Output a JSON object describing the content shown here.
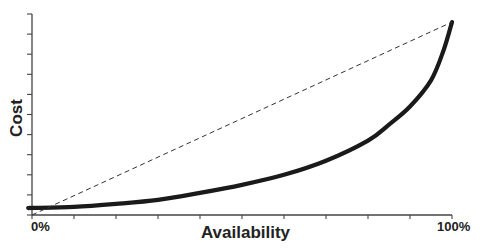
{
  "chart_data": {
    "type": "line",
    "title": "",
    "xlabel": "Availability",
    "ylabel": "Cost",
    "x_tick_labels": {
      "start": "0%",
      "end": "100%"
    },
    "x_ticks_count": 11,
    "y_ticks_count": 11,
    "xlim": [
      0,
      100
    ],
    "ylim": [
      0,
      100
    ],
    "grid": false,
    "legend": null,
    "series": [
      {
        "name": "Actual cost curve",
        "style": "solid-thick",
        "color": "#1a1a1a",
        "x": [
          0,
          10,
          20,
          30,
          40,
          50,
          60,
          70,
          80,
          85,
          90,
          95,
          98,
          100
        ],
        "y": [
          3.5,
          4,
          5.5,
          7.5,
          11,
          15,
          20,
          27,
          37,
          45,
          54,
          67,
          82,
          96
        ]
      },
      {
        "name": "Linear reference",
        "style": "dashed",
        "color": "#333333",
        "x": [
          0,
          100
        ],
        "y": [
          0,
          96
        ]
      }
    ]
  },
  "labels": {
    "x_start": "0%",
    "x_end": "100%",
    "x_title": "Availability",
    "y_title": "Cost"
  }
}
